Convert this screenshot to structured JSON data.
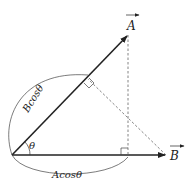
{
  "diagram": {
    "vectors": [
      {
        "name": "A",
        "label": "A",
        "has_arrow_over": true
      },
      {
        "name": "B",
        "label": "B",
        "has_arrow_over": true
      }
    ],
    "angle_label": "θ",
    "projection_labels": {
      "b_on_a": "Bcosθ",
      "a_on_b": "Acosθ"
    },
    "colors": {
      "line": "#222222",
      "dashed": "#555555",
      "background": "#ffffff"
    }
  }
}
